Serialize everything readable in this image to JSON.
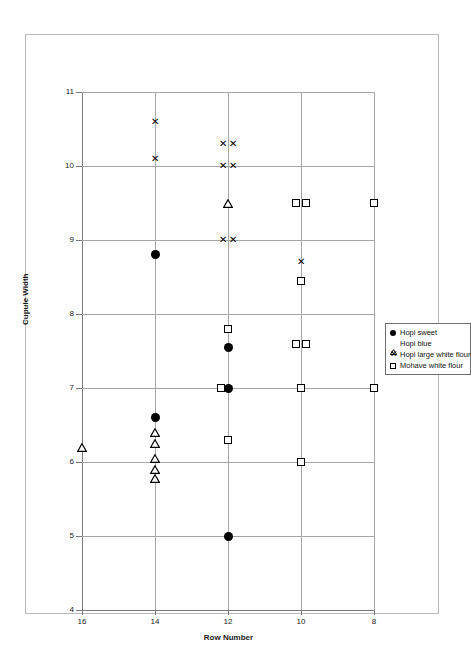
{
  "figure": {
    "x_axis_title": "Row Number",
    "y_axis_title": "Cupule Width"
  },
  "legend": {
    "items": [
      {
        "label": "Hopi sweet",
        "marker": "circle",
        "icon": "filled-circle-icon"
      },
      {
        "label": "Hopi blue",
        "marker": "triangle",
        "icon": "open-triangle-icon"
      },
      {
        "label": "Hopi large white flour",
        "marker": "x",
        "icon": "x-cross-icon"
      },
      {
        "label": "Mohave white flour",
        "marker": "square",
        "icon": "open-square-icon"
      }
    ]
  },
  "chart_data": {
    "type": "scatter",
    "title": "",
    "xlabel": "Row Number",
    "ylabel": "Cupule Width",
    "xlim": [
      16,
      8
    ],
    "ylim": [
      4,
      11
    ],
    "x_ticks": [
      16,
      14,
      12,
      10,
      8
    ],
    "y_ticks": [
      4,
      5,
      6,
      7,
      8,
      9,
      10,
      11
    ],
    "x_axis_reversed": true,
    "grid": true,
    "legend_position": "right-middle",
    "series": [
      {
        "name": "Hopi sweet",
        "marker": "circle",
        "points": [
          {
            "x": 14,
            "y": 8.8
          },
          {
            "x": 14,
            "y": 6.6
          },
          {
            "x": 12,
            "y": 7.55
          },
          {
            "x": 12,
            "y": 7.0
          },
          {
            "x": 12,
            "y": 5.0
          }
        ]
      },
      {
        "name": "Hopi blue",
        "marker": "triangle",
        "points": [
          {
            "x": 16,
            "y": 6.2
          },
          {
            "x": 14,
            "y": 6.4
          },
          {
            "x": 14,
            "y": 6.25
          },
          {
            "x": 14,
            "y": 6.05
          },
          {
            "x": 14,
            "y": 5.9
          },
          {
            "x": 14,
            "y": 5.78
          },
          {
            "x": 12,
            "y": 9.5
          }
        ]
      },
      {
        "name": "Hopi large white flour",
        "marker": "x",
        "points": [
          {
            "x": 14,
            "y": 10.6
          },
          {
            "x": 14,
            "y": 10.1
          },
          {
            "x": 12.15,
            "y": 10.3
          },
          {
            "x": 11.85,
            "y": 10.3
          },
          {
            "x": 12.15,
            "y": 10.0
          },
          {
            "x": 11.85,
            "y": 10.0
          },
          {
            "x": 12.15,
            "y": 9.0
          },
          {
            "x": 11.85,
            "y": 9.0
          },
          {
            "x": 10,
            "y": 8.7
          }
        ]
      },
      {
        "name": "Mohave white flour",
        "marker": "square",
        "points": [
          {
            "x": 12,
            "y": 7.8
          },
          {
            "x": 12.18,
            "y": 7.0
          },
          {
            "x": 12,
            "y": 6.3
          },
          {
            "x": 10.15,
            "y": 9.5
          },
          {
            "x": 9.85,
            "y": 9.5
          },
          {
            "x": 10,
            "y": 8.45
          },
          {
            "x": 10.15,
            "y": 7.6
          },
          {
            "x": 9.85,
            "y": 7.6
          },
          {
            "x": 10,
            "y": 7.0
          },
          {
            "x": 10,
            "y": 6.0
          },
          {
            "x": 8,
            "y": 9.5
          },
          {
            "x": 8,
            "y": 7.0
          }
        ]
      }
    ]
  }
}
